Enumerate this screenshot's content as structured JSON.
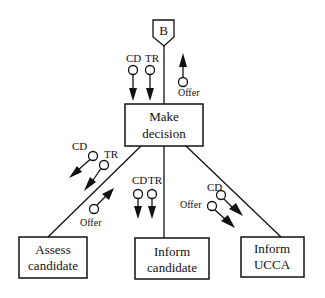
{
  "diagram": {
    "type": "structure-chart",
    "connector": {
      "label": "B"
    },
    "modules": {
      "top": {
        "line1": "Make",
        "line2": "decision"
      },
      "left": {
        "line1": "Assess",
        "line2": "candidate"
      },
      "center": {
        "line1": "Inform",
        "line2": "candidate"
      },
      "right": {
        "line1": "Inform",
        "line2": "UCCA"
      }
    },
    "couples": {
      "top": {
        "cd": "CD",
        "tr": "TR",
        "offer": "Offer"
      },
      "left": {
        "cd": "CD",
        "tr": "TR",
        "offer": "Offer"
      },
      "center": {
        "cd": "CD",
        "tr": "TR"
      },
      "right": {
        "cd": "CD",
        "offer": "Offer"
      }
    }
  }
}
